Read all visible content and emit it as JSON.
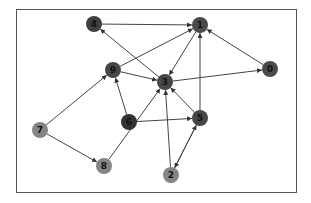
{
  "figure": {
    "width": 311,
    "height": 203,
    "background": "#ffffff",
    "frame": {
      "x": 16,
      "y": 9,
      "width": 280,
      "height": 183,
      "stroke": "#555555"
    }
  },
  "graph": {
    "directed": true,
    "edge_color": "#444444",
    "nodes": [
      {
        "id": "0",
        "label": "0",
        "x": 270,
        "y": 69,
        "color": "#4a4a4a"
      },
      {
        "id": "1",
        "label": "1",
        "x": 200,
        "y": 25,
        "color": "#4a4a4a"
      },
      {
        "id": "2",
        "label": "2",
        "x": 171,
        "y": 175,
        "color": "#858585"
      },
      {
        "id": "3",
        "label": "3",
        "x": 165,
        "y": 82,
        "color": "#474747"
      },
      {
        "id": "4",
        "label": "4",
        "x": 94,
        "y": 24,
        "color": "#3f3f3f"
      },
      {
        "id": "5",
        "label": "5",
        "x": 200,
        "y": 118,
        "color": "#474747"
      },
      {
        "id": "6",
        "label": "6",
        "x": 129,
        "y": 122,
        "color": "#333333"
      },
      {
        "id": "7",
        "label": "7",
        "x": 40,
        "y": 130,
        "color": "#858585"
      },
      {
        "id": "8",
        "label": "8",
        "x": 104,
        "y": 166,
        "color": "#858585"
      },
      {
        "id": "9",
        "label": "9",
        "x": 113,
        "y": 70,
        "color": "#474747"
      }
    ],
    "edges": [
      {
        "from": "4",
        "to": "1"
      },
      {
        "from": "9",
        "to": "1"
      },
      {
        "from": "0",
        "to": "1"
      },
      {
        "from": "5",
        "to": "1"
      },
      {
        "from": "1",
        "to": "3"
      },
      {
        "from": "3",
        "to": "4"
      },
      {
        "from": "3",
        "to": "0"
      },
      {
        "from": "9",
        "to": "3"
      },
      {
        "from": "5",
        "to": "3"
      },
      {
        "from": "2",
        "to": "3"
      },
      {
        "from": "8",
        "to": "3"
      },
      {
        "from": "6",
        "to": "9"
      },
      {
        "from": "6",
        "to": "5"
      },
      {
        "from": "7",
        "to": "9"
      },
      {
        "from": "7",
        "to": "8"
      },
      {
        "from": "2",
        "to": "5"
      },
      {
        "from": "5",
        "to": "2"
      }
    ]
  }
}
